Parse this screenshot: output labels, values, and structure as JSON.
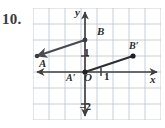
{
  "problem": {
    "number": "10."
  },
  "figure": {
    "grid": {
      "cell_px": 16,
      "cols": 8,
      "rows": 7,
      "color": "#b9c4cf",
      "show": true
    },
    "axes": {
      "color": "#3f3f3f",
      "x_label": "x",
      "y_label": "y",
      "origin_label": "O",
      "x_tick_label": "1",
      "y_tick_label": "1",
      "y_neg_tick_label": "–2",
      "x_range": [
        -4,
        4
      ],
      "y_range": [
        -3,
        4
      ]
    },
    "segments": [
      {
        "name": "segment-AB",
        "color": "#4a4a52",
        "endpoints": [
          {
            "label": "A",
            "x": -3,
            "y": 1
          },
          {
            "label": "B",
            "x": 0,
            "y": 2
          }
        ]
      },
      {
        "name": "segment-A-prime-B-prime",
        "color": "#2e2e34",
        "endpoints": [
          {
            "label": "A′",
            "x": 0,
            "y": 0
          },
          {
            "label": "B′",
            "x": 3,
            "y": 1
          }
        ]
      }
    ],
    "point_labels": {
      "A": "A",
      "B": "B",
      "A_prime": "A′",
      "B_prime": "B′"
    }
  }
}
